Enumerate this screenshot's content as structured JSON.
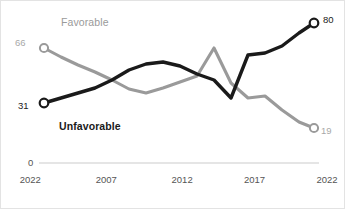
{
  "chart_data": {
    "type": "line",
    "title": "",
    "subtitle": "",
    "xlabel": "",
    "ylabel": "",
    "grid": false,
    "legend_position": "inline-annotation",
    "ylim": [
      0,
      100
    ],
    "axis_baseline_label": "0",
    "x_tick_labels": [
      "2022",
      "2007",
      "2012",
      "2017",
      "2022"
    ],
    "x_tick_positions_pct": [
      8.5,
      30.5,
      52.5,
      73.5,
      94.5
    ],
    "series": [
      {
        "name": "Favorable",
        "color": "#9a9a9a",
        "label_color": "#9a9a9a",
        "start_value": 66,
        "end_value": 19,
        "values": [
          66,
          56,
          47,
          42,
          41,
          44,
          48,
          52,
          65,
          55,
          43,
          41,
          44,
          38,
          30,
          25,
          19
        ],
        "marker_style": "hollow-circle"
      },
      {
        "name": "Unfavorable",
        "color": "#1a1a1a",
        "label_color": "#1a1a1a",
        "start_value": 31,
        "end_value": 80,
        "values": [
          31,
          36,
          41,
          46,
          52,
          57,
          58,
          55,
          52,
          50,
          41,
          57,
          63,
          63,
          68,
          74,
          80
        ],
        "marker_style": "hollow-circle"
      }
    ]
  },
  "annotations": {
    "favorable_label": "Favorable",
    "unfavorable_label": "Unfavorable",
    "favorable_start_value": "66",
    "favorable_end_value": "19",
    "unfavorable_start_value": "31",
    "unfavorable_end_value": "80",
    "zero_label": "0"
  }
}
